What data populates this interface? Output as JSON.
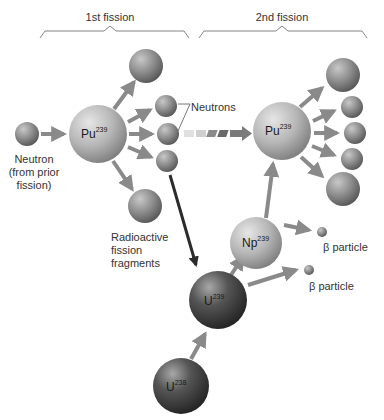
{
  "stages": {
    "first": "1st fission",
    "second": "2nd fission"
  },
  "nuclei": {
    "pu239_first": {
      "symbol": "Pu",
      "mass": "239"
    },
    "pu239_second": {
      "symbol": "Pu",
      "mass": "239"
    },
    "np239": {
      "symbol": "Np",
      "mass": "239"
    },
    "u239": {
      "symbol": "U",
      "mass": "239"
    },
    "u238": {
      "symbol": "U",
      "mass": "238"
    }
  },
  "labels": {
    "neutron_line1": "Neutron",
    "neutron_line2": "(from prior",
    "neutron_line3": "fission)",
    "neutrons": "Neutrons",
    "fragments_line1": "Radioactive",
    "fragments_line2": "fission",
    "fragments_line3": "fragments",
    "beta1": "β particle",
    "beta2": "β particle"
  },
  "colors": {
    "sphere_light": "#d9d9d9",
    "sphere_mid": "#9a9a9a",
    "sphere_dark": "#3a3a3a",
    "arrow": "#8a8a8a",
    "heavy_arrow": "#2b2b2b",
    "text": "#333333"
  }
}
